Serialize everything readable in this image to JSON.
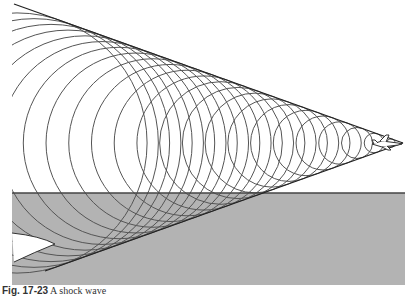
{
  "figure": {
    "colors": {
      "background": "#ffffff",
      "ground": "#b3b3b3",
      "ground_line": "#444444",
      "wavefront": "#555555",
      "cone_line": "#222222"
    },
    "apex": {
      "x": 403,
      "y": 143
    },
    "cone": {
      "upper_end": {
        "x": 14,
        "y": 4
      },
      "lower_end": {
        "x": 45,
        "y": 271
      }
    },
    "ground": {
      "x": 12,
      "y": 193,
      "width": 393,
      "height": 92
    },
    "wavefronts": {
      "count": 23,
      "spacing": 17,
      "first_offset": 12,
      "sin_half_angle": 0.337
    },
    "aircraft_label": "jet"
  },
  "caption": {
    "label": "Fig. 17-23",
    "text": "A shock wave"
  }
}
